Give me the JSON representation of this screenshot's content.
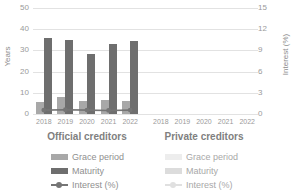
{
  "chart_data": {
    "type": "bar",
    "title": "",
    "subtitle": "",
    "ylabel": "Years",
    "y2label": "Interest (%)",
    "xlabel": "",
    "ylim": [
      0,
      50
    ],
    "y2lim": [
      0,
      15
    ],
    "yticks": [
      "0",
      "10",
      "20",
      "30",
      "40",
      "50"
    ],
    "y2ticks": [
      "0",
      "3",
      "6",
      "9",
      "12",
      "15"
    ],
    "grid": true,
    "legend_position": "bottom",
    "categories": [
      "2018",
      "2019",
      "2020",
      "2021",
      "2022"
    ],
    "groups": [
      {
        "name": "Official creditors",
        "label": "Official creditors",
        "xticks": [
          "2018",
          "2019",
          "2020",
          "2021",
          "2022"
        ],
        "series": [
          {
            "name": "Grace period",
            "axis": "left",
            "values": [
              5.6,
              7.9,
              6.2,
              6.7,
              6.0
            ]
          },
          {
            "name": "Maturity",
            "axis": "left",
            "values": [
              36.0,
              35.1,
              28.5,
              33.0,
              34.5
            ]
          },
          {
            "name": "Interest (%)",
            "axis": "right",
            "values": [
              0.55,
              0.6,
              0.55,
              0.5,
              0.55
            ]
          }
        ]
      },
      {
        "name": "Private creditors",
        "label": "Private creditors",
        "xticks": [
          "2018",
          "2019",
          "2020",
          "2021",
          "2022"
        ],
        "series": [
          {
            "name": "Grace period",
            "axis": "left",
            "values": [
              0,
              0,
              0,
              0,
              0
            ]
          },
          {
            "name": "Maturity",
            "axis": "left",
            "values": [
              0,
              0,
              0,
              0,
              0
            ]
          },
          {
            "name": "Interest (%)",
            "axis": "right",
            "values": [
              null,
              null,
              null,
              null,
              null
            ]
          }
        ]
      }
    ],
    "legend": {
      "official": [
        "Grace period",
        "Maturity",
        "Interest (%)"
      ],
      "private": [
        "Grace period",
        "Maturity",
        "Interest (%)"
      ]
    },
    "colors": {
      "grace_period": "#a8a8a8",
      "maturity": "#6e6e6e",
      "interest_line": "#757575",
      "grace_period_faint": "#ededed",
      "maturity_faint": "#dcdcdc",
      "interest_line_faint": "#e0e0e0",
      "gridline": "#e2e2e2",
      "text": "#9a9a9a",
      "background": "#ffffff"
    }
  }
}
